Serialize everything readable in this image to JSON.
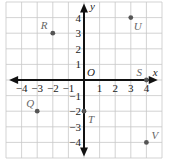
{
  "diagram": {
    "type": "coordinate-plane",
    "x_axis_label": "x",
    "y_axis_label": "y",
    "origin_label": "O",
    "x_range": [
      -5,
      5
    ],
    "y_range": [
      -5,
      5
    ],
    "x_ticks": [
      -4,
      -3,
      -2,
      -1,
      1,
      2,
      3,
      4
    ],
    "y_ticks": [
      -4,
      -3,
      -2,
      -1,
      1,
      2,
      3,
      4
    ],
    "x_tick_labels": [
      "−4",
      "−3",
      "−2",
      "−1",
      "1",
      "2",
      "3",
      "4"
    ],
    "y_tick_labels": [
      "−4",
      "−3",
      "−2",
      "−1",
      "1",
      "2",
      "3",
      "4"
    ],
    "grid": true,
    "points": [
      {
        "name": "R",
        "x": -2,
        "y": 3
      },
      {
        "name": "U",
        "x": 3,
        "y": 4
      },
      {
        "name": "S",
        "x": 4,
        "y": 0
      },
      {
        "name": "Q",
        "x": -3,
        "y": -2
      },
      {
        "name": "T",
        "x": 0,
        "y": -2
      },
      {
        "name": "V",
        "x": 4,
        "y": -4
      }
    ],
    "colors": {
      "grid": "#c8c8c8",
      "axis": "#111111",
      "point": "#555555",
      "point_label": "#666666"
    }
  }
}
